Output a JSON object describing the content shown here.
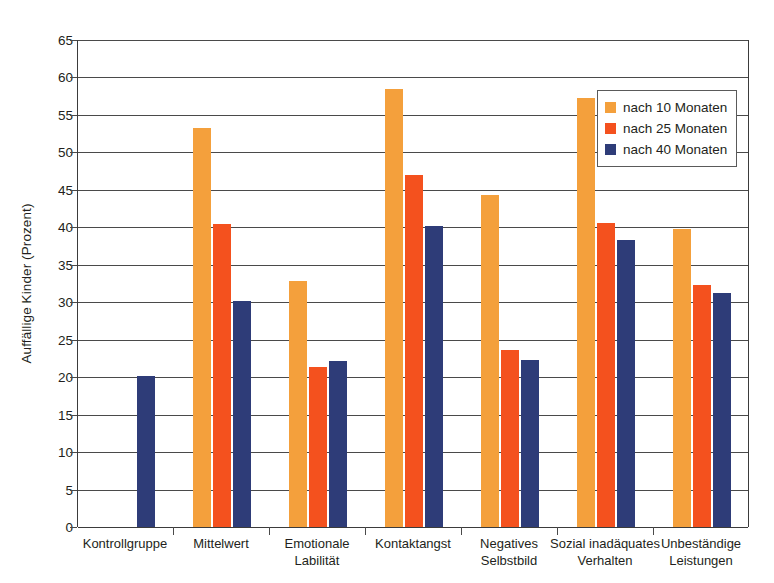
{
  "chart_data": {
    "type": "bar",
    "title": "",
    "xlabel": "",
    "ylabel": "Auffällige Kinder (Prozent)",
    "ylim": [
      0,
      65
    ],
    "ytick_step": 5,
    "yticks": [
      0,
      5,
      10,
      15,
      20,
      25,
      30,
      35,
      40,
      45,
      50,
      55,
      60,
      65
    ],
    "ytick_labels": [
      "0",
      "5",
      "10",
      "15",
      "20",
      "25",
      "30",
      "35",
      "40",
      "45",
      "50",
      "55",
      "60",
      "65"
    ],
    "grid": true,
    "legend_position": "top-right",
    "categories": [
      "Kontrollgruppe",
      "Mittelwert",
      "Emotionale\nLabilität",
      "Kontaktangst",
      "Negatives\nSelbstbild",
      "Sozial inadäquates\nVerhalten",
      "Unbeständige\nLeistungen"
    ],
    "series": [
      {
        "name": "nach 10 Monaten",
        "color": "#f4a03c",
        "values": [
          null,
          53.3,
          32.8,
          58.4,
          44.3,
          57.2,
          39.8
        ]
      },
      {
        "name": "nach 25 Monaten",
        "color": "#f4511e",
        "values": [
          null,
          40.4,
          21.4,
          47.0,
          23.6,
          40.6,
          32.3
        ]
      },
      {
        "name": "nach 40 Monaten",
        "color": "#2e3c78",
        "values": [
          20.1,
          30.1,
          22.2,
          40.2,
          22.3,
          38.3,
          31.3
        ]
      }
    ]
  },
  "legend": {
    "items": [
      {
        "label": "nach 10 Monaten",
        "color": "#f4a03c"
      },
      {
        "label": "nach 25 Monaten",
        "color": "#f4511e"
      },
      {
        "label": "nach 40 Monaten",
        "color": "#2e3c78"
      }
    ]
  },
  "colors": {
    "series_10_months": "#f4a03c",
    "series_25_months": "#f4511e",
    "series_40_months": "#2e3c78",
    "axis": "#3b3b3b",
    "grid": "#4a4a4a",
    "text": "#231f20",
    "background": "#ffffff"
  }
}
